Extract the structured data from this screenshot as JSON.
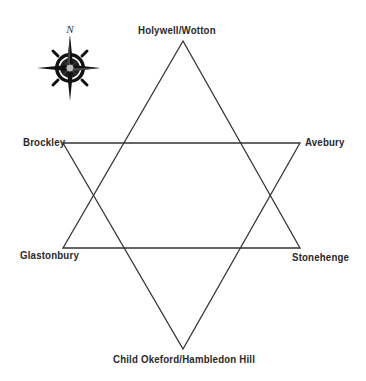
{
  "diagram": {
    "type": "hexagram",
    "line_color": "#333333",
    "compass": {
      "icon": "compass-rose-icon",
      "north_label": "N"
    },
    "nodes": [
      {
        "id": "top",
        "label": "Holywell/Wotton",
        "x": 183,
        "y": 41
      },
      {
        "id": "upper-left",
        "label": "Brockley",
        "x": 63,
        "y": 143
      },
      {
        "id": "upper-right",
        "label": "Avebury",
        "x": 300,
        "y": 143
      },
      {
        "id": "lower-left",
        "label": "Glastonbury",
        "x": 63,
        "y": 248
      },
      {
        "id": "lower-right",
        "label": "Stonehenge",
        "x": 300,
        "y": 248
      },
      {
        "id": "bottom",
        "label": "Child Okeford/Hambledon Hill",
        "x": 183,
        "y": 349
      }
    ],
    "triangles": [
      {
        "name": "upward",
        "vertices": [
          "top",
          "lower-left",
          "lower-right"
        ]
      },
      {
        "name": "downward",
        "vertices": [
          "upper-left",
          "upper-right",
          "bottom"
        ]
      }
    ]
  }
}
